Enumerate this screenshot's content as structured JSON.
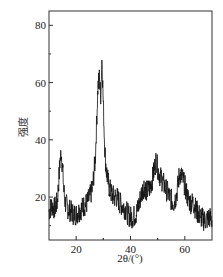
{
  "chart_data": {
    "type": "line",
    "title": "",
    "xlabel": "2θ/(°)",
    "ylabel": "强度",
    "xlim": [
      10,
      70
    ],
    "ylim": [
      5,
      85
    ],
    "xticks": [
      20,
      40,
      60
    ],
    "yticks": [
      20,
      40,
      60,
      80
    ],
    "grid": false,
    "legend": null,
    "series": [
      {
        "name": "XRD pattern",
        "color": "#111111",
        "x": [
          10,
          11,
          12,
          13,
          13.5,
          14,
          14.5,
          15,
          15.5,
          16,
          17,
          18,
          19,
          20,
          21,
          22,
          23,
          24,
          25,
          26,
          27,
          27.5,
          28,
          28.5,
          29,
          29.5,
          30,
          30.5,
          31,
          32,
          33,
          34,
          35,
          36,
          37,
          38,
          39,
          40,
          41,
          42,
          43,
          44,
          45,
          46,
          47,
          48,
          49,
          49.5,
          50,
          51,
          52,
          53,
          54,
          55,
          56,
          57,
          58,
          59,
          60,
          61,
          62,
          63,
          64,
          65,
          66,
          67,
          68,
          69,
          70
        ],
        "y": [
          15,
          17,
          16,
          18,
          24,
          32,
          36,
          30,
          22,
          18,
          16,
          15,
          14,
          14,
          15,
          16,
          17,
          18,
          20,
          23,
          33,
          45,
          58,
          62,
          55,
          69,
          52,
          38,
          30,
          24,
          21,
          20,
          20,
          18,
          17,
          16,
          14,
          13,
          13,
          14,
          17,
          21,
          24,
          22,
          23,
          26,
          31,
          33,
          30,
          27,
          25,
          23,
          21,
          19,
          18,
          21,
          28,
          27,
          24,
          20,
          18,
          18,
          16,
          14,
          13,
          12,
          12,
          13,
          12
        ]
      }
    ]
  }
}
